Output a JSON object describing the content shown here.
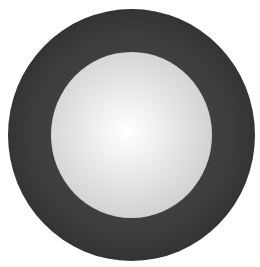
{
  "figure": {
    "type": "concentric-circles",
    "outer_circle": {
      "color_edge": "#111111",
      "color_body": "#3e3e3e"
    },
    "inner_circle": {
      "color_center": "#ffffff",
      "color_edge": "#bdbdbd"
    }
  }
}
